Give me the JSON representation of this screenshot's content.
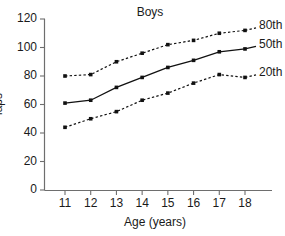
{
  "chart_data": {
    "type": "line",
    "title": "Boys",
    "xlabel": "Age (years)",
    "ylabel": "laps",
    "x": [
      11,
      12,
      13,
      14,
      15,
      16,
      17,
      18
    ],
    "xticklabels": [
      "11",
      "12",
      "13",
      "14",
      "15",
      "16",
      "17",
      "18"
    ],
    "yticklabels": [
      "0",
      "20",
      "40",
      "60",
      "80",
      "100",
      "120"
    ],
    "yticks": [
      0,
      20,
      40,
      60,
      80,
      100,
      120
    ],
    "xlim": [
      10.5,
      18.8
    ],
    "ylim": [
      0,
      120
    ],
    "grid": false,
    "legend_position": "right-inline",
    "series": [
      {
        "name": "80th",
        "label": "80th",
        "linestyle": "dotted",
        "marker": "square",
        "color": "#111111",
        "values": [
          80,
          81,
          90,
          96,
          102,
          105,
          110,
          112
        ]
      },
      {
        "name": "50th",
        "label": "50th",
        "linestyle": "solid",
        "marker": "square",
        "color": "#111111",
        "values": [
          61,
          63,
          72,
          79,
          86,
          91,
          97,
          99
        ]
      },
      {
        "name": "20th",
        "label": "20th",
        "linestyle": "dotted",
        "marker": "square",
        "color": "#111111",
        "values": [
          44,
          50,
          55,
          63,
          68,
          75,
          81,
          79
        ]
      }
    ]
  }
}
